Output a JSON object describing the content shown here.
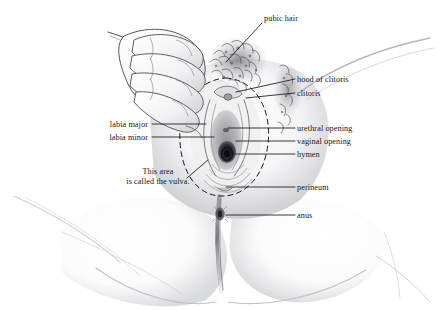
{
  "illustration": {
    "title": "External female genital anatomy",
    "style": "pencil-sketch anatomical diagram",
    "background_color": "#ffffff",
    "line_color": "#15161a",
    "pencil_color": "#8a8b90",
    "alt": "Pencil drawing of a woman's vulva with a hand holding the labia open, viewed from below, with labeled parts."
  },
  "labels": [
    {
      "id": "pubic-hair",
      "text": "pubic hair",
      "x": 264,
      "y": 18,
      "align": "left"
    },
    {
      "id": "hood-of-clitoris",
      "text": "hood of clitoris",
      "x": 297,
      "y": 82,
      "align": "left"
    },
    {
      "id": "clitoris",
      "text": "clitoris",
      "x": 297,
      "y": 96,
      "align": "left"
    },
    {
      "id": "labia-major",
      "text": "labia major",
      "x": 148,
      "y": 126,
      "align": "right"
    },
    {
      "id": "labia-minor",
      "text": "labia minor",
      "x": 148,
      "y": 139,
      "align": "right"
    },
    {
      "id": "urethral-opening",
      "text": "urethral opening",
      "x": 297,
      "y": 130,
      "align": "left"
    },
    {
      "id": "vaginal-opening",
      "text": "vaginal opening",
      "x": 297,
      "y": 143,
      "align": "left"
    },
    {
      "id": "hymen",
      "text": "hymen",
      "x": 297,
      "y": 156,
      "align": "left"
    },
    {
      "id": "perineum",
      "text": "perineum",
      "x": 297,
      "y": 189,
      "align": "left"
    },
    {
      "id": "anus",
      "text": "anus",
      "x": 297,
      "y": 217,
      "align": "left"
    }
  ],
  "annotation": {
    "id": "vulva-note",
    "line1": "This area",
    "line2": "is called the vulva.",
    "x": 120,
    "y": 171
  }
}
